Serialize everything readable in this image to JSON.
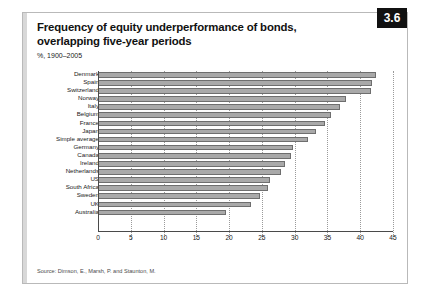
{
  "exhibit": {
    "badge": "3.6",
    "title": "Frequency of equity underperformance of bonds, overlapping five-year periods",
    "subtitle": "%, 1900–2005",
    "source": "Source: Dimson, E., Marsh, P. and Staunton, M."
  },
  "colors": {
    "bar_fill": "#a9a9a9",
    "bar_edge": "#6e6e6e",
    "badge_bg": "#111111",
    "badge_fg": "#ffffff",
    "axis": "#4a4a4a",
    "grid": "#9a9a9a"
  },
  "chart_data": {
    "type": "bar",
    "orientation": "horizontal",
    "title": "Frequency of equity underperformance of bonds, overlapping five-year periods",
    "subtitle": "%, 1900–2005",
    "xlabel": "",
    "ylabel": "",
    "xlim": [
      0,
      45
    ],
    "xticks": [
      0,
      5,
      10,
      15,
      20,
      25,
      30,
      35,
      40,
      45
    ],
    "grid": "vertical-dotted",
    "legend": "none",
    "categories": [
      "Denmark",
      "Spain",
      "Switzerland",
      "Norway",
      "Italy",
      "Belgium",
      "France",
      "Japan",
      "Simple average",
      "Germany",
      "Canada",
      "Ireland",
      "Netherlands",
      "US",
      "South Africa",
      "Sweden",
      "UK",
      "Australia"
    ],
    "values": [
      42.4,
      41.8,
      41.6,
      37.8,
      36.9,
      35.5,
      34.6,
      33.3,
      32.0,
      29.7,
      29.4,
      28.5,
      27.9,
      26.2,
      25.9,
      24.7,
      23.4,
      19.6
    ],
    "source": "Source: Dimson, E., Marsh, P. and Staunton, M."
  }
}
